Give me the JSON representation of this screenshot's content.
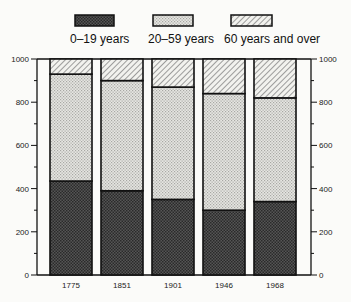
{
  "chart_data": {
    "type": "bar",
    "stacked": true,
    "title": "",
    "xlabel": "",
    "ylabel": "",
    "ylim": [
      0,
      1000
    ],
    "yticks": [
      0,
      200,
      400,
      600,
      800,
      1000
    ],
    "ytick_labels": [
      "0",
      "200",
      "400",
      "600",
      "800",
      "1000"
    ],
    "y_axis_both_sides": true,
    "grid": false,
    "legend_position": "top",
    "categories": [
      "1775",
      "1851",
      "1901",
      "1946",
      "1968"
    ],
    "series": [
      {
        "name": "0–19 years",
        "pattern": "dense-dark-dots",
        "values": [
          435,
          390,
          350,
          300,
          340
        ]
      },
      {
        "name": "20–59 years",
        "pattern": "light-dots",
        "values": [
          495,
          510,
          520,
          540,
          480
        ]
      },
      {
        "name": "60 years and over",
        "pattern": "diagonal-hatch",
        "values": [
          70,
          100,
          130,
          160,
          180
        ]
      }
    ],
    "cumulative_boundaries": {
      "0-19_top": [
        435,
        390,
        350,
        300,
        340
      ],
      "20-59_top": [
        930,
        900,
        870,
        840,
        820
      ]
    }
  },
  "legend": {
    "items": [
      {
        "label": "0–19 years"
      },
      {
        "label": "20–59 years"
      },
      {
        "label": "60 years and over"
      }
    ]
  },
  "axes": {
    "left_labels": [
      "1000",
      "800",
      "600",
      "400",
      "200",
      "0"
    ],
    "right_labels": [
      "1000",
      "800",
      "600",
      "400",
      "200",
      "0"
    ]
  },
  "colors": {
    "dark": "#4a4a4a",
    "light": "#d8d8d4",
    "hatch": "#e8e8e4",
    "outline": "#111111"
  }
}
